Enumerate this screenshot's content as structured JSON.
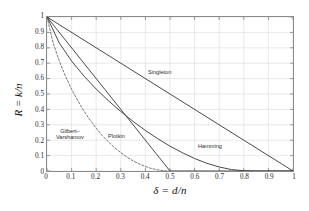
{
  "chart_data": {
    "type": "line",
    "title": "",
    "xlabel": "δ = d/n",
    "ylabel": "R = k/n",
    "xlim": [
      0,
      1
    ],
    "ylim": [
      0,
      1
    ],
    "grid": true,
    "legend_position": "inline-annotations",
    "xticks": [
      "0",
      "0.1",
      "0.2",
      "0.3",
      "0.4",
      "0.5",
      "0.6",
      "0.7",
      "0.8",
      "0.9",
      "1"
    ],
    "yticks": [
      "0",
      "0.1",
      "0.2",
      "0.3",
      "0.4",
      "0.5",
      "0.6",
      "0.7",
      "0.8",
      "0.9",
      "1"
    ],
    "xtick_values": [
      0,
      0.1,
      0.2,
      0.3,
      0.4,
      0.5,
      0.6,
      0.7,
      0.8,
      0.9,
      1
    ],
    "ytick_values": [
      0,
      0.1,
      0.2,
      0.3,
      0.4,
      0.5,
      0.6,
      0.7,
      0.8,
      0.9,
      1
    ],
    "series": [
      {
        "name": "Singleton",
        "label": "Singleton",
        "style": "solid",
        "color": "#333333",
        "x": [
          0,
          1
        ],
        "values": [
          1,
          0
        ]
      },
      {
        "name": "Hamming",
        "label": "Hamming",
        "style": "solid",
        "color": "#333333",
        "x": [
          0,
          0.05,
          0.1,
          0.15,
          0.2,
          0.25,
          0.3,
          0.35,
          0.4,
          0.45,
          0.5,
          0.55,
          0.6,
          0.65,
          0.7,
          0.75,
          0.8,
          0.85,
          0.9,
          0.95,
          1.0
        ],
        "values": [
          1,
          0.831,
          0.714,
          0.617,
          0.532,
          0.456,
          0.386,
          0.322,
          0.263,
          0.21,
          0.161,
          0.119,
          0.081,
          0.05,
          0.026,
          0.0095,
          0.0016,
          0.0,
          0.0,
          0.0,
          0.0
        ]
      },
      {
        "name": "Plotkin",
        "label": "Plotkin",
        "style": "solid",
        "color": "#333333",
        "x": [
          0,
          0.5,
          1
        ],
        "values": [
          1,
          0,
          0
        ]
      },
      {
        "name": "Gilbert-Varshamov",
        "label": "Gilbert–Varshamov",
        "label_line1": "Gilbert–",
        "label_line2": "Varshamov",
        "style": "dashed",
        "color": "#555555",
        "x": [
          0,
          0.025,
          0.05,
          0.075,
          0.1,
          0.125,
          0.15,
          0.175,
          0.2,
          0.225,
          0.25,
          0.275,
          0.3,
          0.325,
          0.35,
          0.375,
          0.4,
          0.425,
          0.45,
          0.475,
          0.5
        ],
        "values": [
          1,
          0.831,
          0.714,
          0.615,
          0.531,
          0.457,
          0.39,
          0.331,
          0.278,
          0.229,
          0.189,
          0.151,
          0.119,
          0.09,
          0.066,
          0.046,
          0.029,
          0.016,
          0.007,
          0.0018,
          0.0
        ]
      }
    ],
    "annotations": [
      {
        "name": "singleton-label",
        "text": "Singleton",
        "x": 0.41,
        "y": 0.62
      },
      {
        "name": "hamming-label",
        "text": "Hamming",
        "x": 0.615,
        "y": 0.175
      },
      {
        "name": "plotkin-label",
        "text": "Plotkin",
        "x": 0.25,
        "y": 0.235
      },
      {
        "name": "gv-label",
        "text": "Gilbert–Varshamov",
        "x": 0.08,
        "y": 0.26
      }
    ]
  },
  "figure": {
    "watermark": ""
  }
}
